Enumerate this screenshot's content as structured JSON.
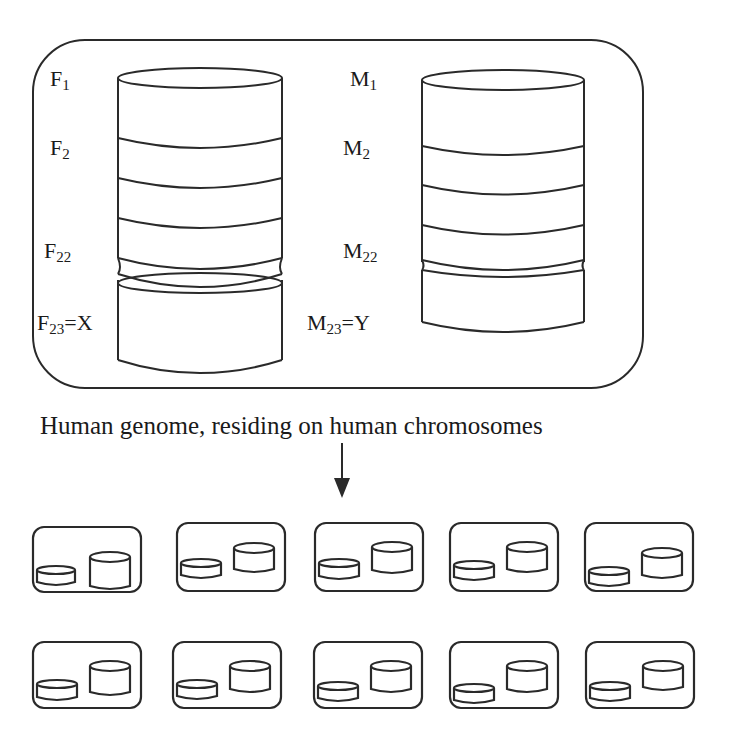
{
  "figure": {
    "caption": "Human genome, residing on human chromosomes",
    "stroke_color": "#2a2a2a",
    "background": "#ffffff"
  },
  "female_stack": {
    "labels": [
      {
        "base": "F",
        "sub": "1",
        "suffix": ""
      },
      {
        "base": "F",
        "sub": "2",
        "suffix": ""
      },
      {
        "base": "F",
        "sub": "22",
        "suffix": ""
      },
      {
        "base": "F",
        "sub": "23",
        "suffix": "=X"
      }
    ]
  },
  "male_stack": {
    "labels": [
      {
        "base": "M",
        "sub": "1",
        "suffix": ""
      },
      {
        "base": "M",
        "sub": "2",
        "suffix": ""
      },
      {
        "base": "M",
        "sub": "22",
        "suffix": ""
      },
      {
        "base": "M",
        "sub": "23",
        "suffix": "=Y"
      }
    ]
  },
  "genome_copies": {
    "rows": 2,
    "columns": 5,
    "count": 10
  }
}
